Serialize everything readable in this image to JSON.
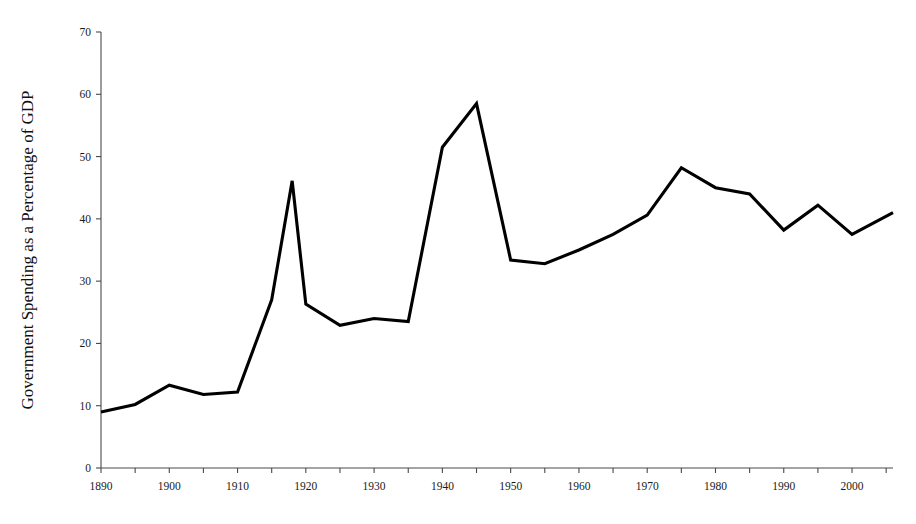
{
  "chart_data": {
    "type": "line",
    "title": "",
    "xlabel": "",
    "ylabel": "Government Spending as a Percentage of GDP",
    "xlim": [
      1890,
      2006
    ],
    "ylim": [
      0,
      70
    ],
    "grid": false,
    "legend": null,
    "y_ticks": [
      0,
      10,
      20,
      30,
      40,
      50,
      60,
      70
    ],
    "y_tick_labels": [
      "0",
      "10",
      "20",
      "30",
      "40",
      "50",
      "60",
      "70"
    ],
    "x_tick_labels": [
      "1890",
      "1900",
      "1910",
      "1920",
      "1930",
      "1940",
      "1950",
      "1960",
      "1970",
      "1980",
      "1990",
      "2000"
    ],
    "x_labeled_ticks": [
      1890,
      1900,
      1910,
      1920,
      1930,
      1940,
      1950,
      1960,
      1970,
      1980,
      1990,
      2000
    ],
    "x_minor_ticks": [
      1895,
      1905,
      1915,
      1925,
      1935,
      1945,
      1955,
      1965,
      1975,
      1985,
      1995,
      2005
    ],
    "line_color": "#000000",
    "axis_color": "#4a4a4a",
    "series": [
      {
        "name": "Government Spending as a Percentage of GDP",
        "x": [
          1890,
          1895,
          1900,
          1905,
          1910,
          1915,
          1918,
          1920,
          1925,
          1930,
          1935,
          1940,
          1945,
          1950,
          1955,
          1960,
          1965,
          1970,
          1975,
          1980,
          1985,
          1990,
          1995,
          2000,
          2006
        ],
        "values": [
          9.0,
          10.2,
          13.3,
          11.8,
          12.2,
          27.0,
          46.1,
          26.3,
          22.9,
          24.0,
          23.5,
          51.5,
          58.5,
          33.4,
          32.8,
          35.0,
          37.5,
          40.6,
          48.2,
          45.0,
          44.0,
          38.2,
          42.2,
          37.5,
          41.0
        ]
      }
    ]
  },
  "axis_titles": {
    "y": "Government Spending as a Percentage of GDP"
  }
}
